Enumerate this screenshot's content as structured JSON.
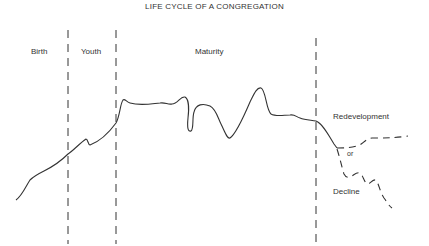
{
  "title": "LIFE CYCLE OF A CONGREGATION",
  "phases": [
    {
      "label": "Birth",
      "x": 31,
      "y": 48
    },
    {
      "label": "Youth",
      "x": 81,
      "y": 48
    },
    {
      "label": "Maturity",
      "x": 195,
      "y": 48
    }
  ],
  "outcomes": [
    {
      "label": "Redevelopment",
      "x": 333,
      "y": 113
    },
    {
      "label": "or",
      "x": 348,
      "y": 151
    },
    {
      "label": "Decline",
      "x": 333,
      "y": 188
    }
  ],
  "dividers_x": [
    68,
    116,
    316
  ],
  "colors": {
    "line": "#333333",
    "background": "#ffffff"
  }
}
